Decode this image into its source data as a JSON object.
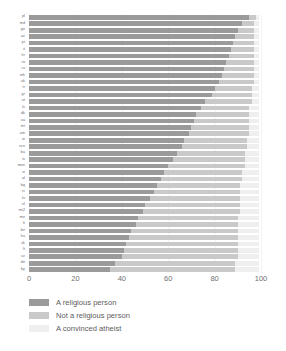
{
  "chart_data": {
    "type": "bar",
    "orientation": "horizontal",
    "stacked": true,
    "title": "",
    "xlabel": "",
    "ylabel": "",
    "xlim": [
      0,
      100
    ],
    "xticks": [
      0,
      20,
      40,
      60,
      80,
      100
    ],
    "xtick_labels": [
      "0",
      "20",
      "40",
      "60",
      "80",
      "100"
    ],
    "grid": true,
    "legend_position": "below",
    "colors": {
      "religious": "#9a9a9a",
      "not_religious": "#c9c9c9",
      "atheist": "#efefef",
      "background": "#ffffff",
      "gridline": "#f4f4f4",
      "text": "#5d5d5d"
    },
    "series": [
      {
        "name": "A religious person",
        "key": "religious"
      },
      {
        "name": "Not a religious person",
        "key": "not_religious"
      },
      {
        "name": "A convinced atheist",
        "key": "atheist"
      }
    ],
    "categories": [
      "pl",
      "md",
      "ge",
      "az",
      "pt",
      "it",
      "hr",
      "ro",
      "ru",
      "mk",
      "uk",
      "tr",
      "gr",
      "at",
      "lv",
      "dk",
      "ua",
      "mt",
      "am",
      "ie",
      "scn",
      "ba",
      "is",
      "mon",
      "si",
      "al",
      "bg",
      "rs",
      "lu",
      "nl",
      "mt2",
      "me",
      "fi",
      "be",
      "hu",
      "sk",
      "lt",
      "cz",
      "de",
      "by"
    ],
    "values": {
      "religious": [
        95,
        92,
        90,
        89,
        88,
        87,
        86,
        85,
        84,
        83,
        82,
        80,
        79,
        76,
        74,
        72,
        71,
        70,
        69,
        67,
        66,
        64,
        62,
        60,
        58,
        57,
        55,
        54,
        52,
        50,
        49,
        47,
        46,
        44,
        43,
        42,
        41,
        40,
        37,
        35
      ],
      "not_religious": [
        3,
        5,
        7,
        8,
        9,
        10,
        11,
        12,
        13,
        14,
        15,
        16,
        17,
        20,
        21,
        23,
        24,
        25,
        26,
        27,
        28,
        29,
        31,
        33,
        34,
        35,
        36,
        37,
        39,
        41,
        42,
        43,
        44,
        46,
        47,
        48,
        49,
        50,
        52,
        54
      ],
      "atheist": [
        1,
        2,
        2,
        2,
        2,
        2,
        2,
        2,
        2,
        2,
        2,
        3,
        3,
        3,
        4,
        4,
        4,
        4,
        4,
        5,
        5,
        6,
        6,
        6,
        7,
        7,
        8,
        8,
        8,
        8,
        8,
        9,
        9,
        9,
        9,
        9,
        9,
        9,
        10,
        10
      ]
    }
  },
  "legend": {
    "items": [
      {
        "label": "A religious person"
      },
      {
        "label": "Not a religious person"
      },
      {
        "label": "A convinced atheist"
      }
    ]
  }
}
